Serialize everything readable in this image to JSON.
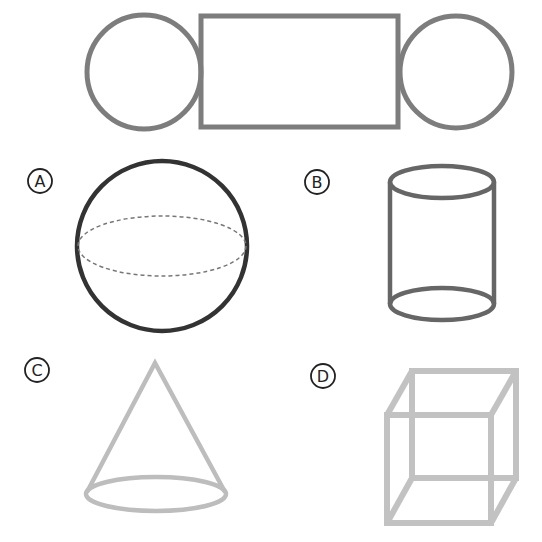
{
  "net": {
    "description": "Net of a solid: two circles attached to a rectangle",
    "stroke": "#7d7d7d",
    "left_circle": {
      "cx": 144,
      "cy": 72,
      "r": 57
    },
    "rectangle": {
      "x": 201,
      "y": 16,
      "w": 197,
      "h": 111
    },
    "right_circle": {
      "cx": 456,
      "cy": 72,
      "r": 56
    }
  },
  "options": [
    {
      "id": "A",
      "label": "A",
      "shape": "sphere",
      "label_pos": {
        "cx": 40,
        "cy": 181
      },
      "stroke": "#333333"
    },
    {
      "id": "B",
      "label": "B",
      "shape": "cylinder",
      "label_pos": {
        "cx": 317,
        "cy": 182
      },
      "stroke": "#666666"
    },
    {
      "id": "C",
      "label": "C",
      "shape": "cone",
      "label_pos": {
        "cx": 37,
        "cy": 370
      },
      "stroke": "#bdbdbd"
    },
    {
      "id": "D",
      "label": "D",
      "shape": "cube",
      "label_pos": {
        "cx": 323,
        "cy": 376
      },
      "stroke": "#c2c2c2"
    }
  ]
}
